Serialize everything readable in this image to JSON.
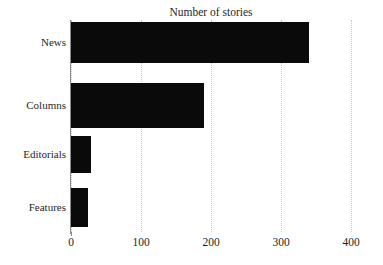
{
  "chart_data": {
    "type": "bar",
    "orientation": "horizontal",
    "title": "Number of stories",
    "xlabel": "",
    "ylabel": "",
    "categories": [
      "News",
      "Columns",
      "Editorials",
      "Features"
    ],
    "values": [
      340,
      190,
      29,
      24
    ],
    "xlim": [
      0,
      400
    ],
    "xticks": [
      0,
      100,
      200,
      300,
      400
    ],
    "xtick_labels": [
      "0",
      "100",
      "200",
      "300",
      "400"
    ],
    "grid": true,
    "grid_axis": "x",
    "grid_style": "dotted",
    "legend": false,
    "legend_position": "none",
    "bar_color": "#0a0a0a",
    "grid_color": "#c9c9c9",
    "axis_color": "#8a8a8a",
    "background_color": "#ffffff",
    "text_color": "#1f1f1f"
  }
}
